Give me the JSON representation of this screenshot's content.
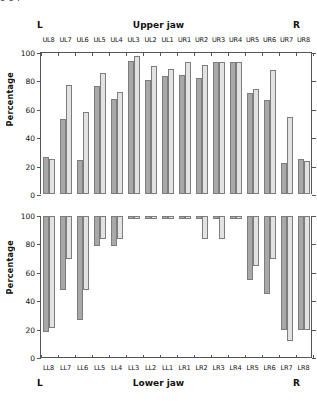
{
  "figure": {
    "cutoff_text": "g                              g                         p",
    "upper": {
      "title": "Upper jaw",
      "left_mark": "L",
      "right_mark": "R",
      "ylabel": "Percentage"
    },
    "lower": {
      "title": "Lower jaw",
      "left_mark": "L",
      "right_mark": "R",
      "ylabel": "Percentage"
    }
  },
  "chart_data": [
    {
      "type": "bar",
      "title": "Upper jaw",
      "xlabel": "",
      "ylabel": "Percentage",
      "ylim": [
        0,
        100
      ],
      "yticks": [
        0,
        20,
        40,
        60,
        80,
        100
      ],
      "grid": false,
      "legend": "none",
      "orientation": "up",
      "categories": [
        "UL8",
        "UL7",
        "UL6",
        "UL5",
        "UL4",
        "UL3",
        "UL2",
        "UL1",
        "UR1",
        "UR2",
        "UR3",
        "UR4",
        "UR5",
        "UR6",
        "UR7",
        "UR8"
      ],
      "series": [
        {
          "name": "series-a",
          "color": "#a8a8a8",
          "values": [
            26,
            53,
            24,
            76,
            67,
            94,
            80,
            83,
            84,
            82,
            93,
            93,
            71,
            66,
            22,
            25
          ]
        },
        {
          "name": "series-b",
          "color": "#e2e2e2",
          "values": [
            25,
            77,
            58,
            85,
            72,
            97,
            90,
            88,
            93,
            91,
            93,
            93,
            74,
            87,
            54,
            23
          ]
        }
      ]
    },
    {
      "type": "bar",
      "title": "Lower jaw",
      "xlabel": "",
      "ylabel": "Percentage",
      "ylim": [
        0,
        100
      ],
      "yticks": [
        0,
        20,
        40,
        60,
        80,
        100
      ],
      "grid": false,
      "legend": "none",
      "orientation": "down",
      "categories": [
        "LL8",
        "LL7",
        "LL6",
        "LL5",
        "LL4",
        "LL3",
        "LL2",
        "LL1",
        "LR1",
        "LR2",
        "LR3",
        "LR4",
        "LR5",
        "LR6",
        "LR7",
        "LR8"
      ],
      "series": [
        {
          "name": "series-a",
          "color": "#a8a8a8",
          "values": [
            82,
            52,
            73,
            21,
            21,
            2,
            2,
            2,
            2,
            2,
            2,
            2,
            45,
            55,
            80,
            80
          ]
        },
        {
          "name": "series-b",
          "color": "#e2e2e2",
          "values": [
            79,
            30,
            52,
            16,
            16,
            2,
            2,
            2,
            2,
            16,
            16,
            2,
            35,
            30,
            88,
            80
          ]
        }
      ]
    }
  ]
}
